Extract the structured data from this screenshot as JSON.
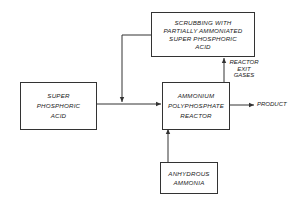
{
  "diagram": {
    "type": "process-flow",
    "nodes": {
      "scrubbing": {
        "label": "SCRUBBING WITH\nPARTIALLY AMMONIATED\nSUPER PHOSPHORIC\nACID"
      },
      "super_phosphoric_acid": {
        "label": "SUPER\nPHOSPHORIC\nACID"
      },
      "reactor": {
        "label": "AMMONIUM\nPOLYPHOSPHATE\nREACTOR"
      },
      "anhydrous_ammonia": {
        "label": "ANHYDROUS\nAMMONIA"
      }
    },
    "edge_labels": {
      "reactor_exit_gases": "REACTOR\nEXIT\nGASES",
      "product": "PRODUCT"
    },
    "edges": [
      {
        "from": "super_phosphoric_acid",
        "to": "reactor"
      },
      {
        "from": "scrubbing",
        "to": "reactor",
        "via": "junction on acid feed line"
      },
      {
        "from": "reactor",
        "to": "scrubbing",
        "label": "REACTOR EXIT GASES"
      },
      {
        "from": "anhydrous_ammonia",
        "to": "reactor"
      },
      {
        "from": "reactor",
        "to": "output",
        "label": "PRODUCT"
      }
    ]
  }
}
